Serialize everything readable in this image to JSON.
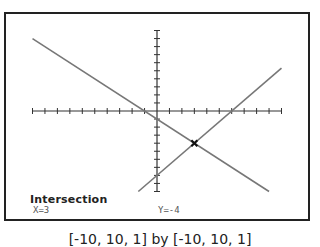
{
  "chart_data": {
    "type": "line",
    "title": "",
    "xlabel": "",
    "ylabel": "",
    "xlim": [
      -10,
      10
    ],
    "ylim": [
      -10,
      10
    ],
    "xscale": 1,
    "yscale": 1,
    "grid": false,
    "series": [
      {
        "name": "Y1",
        "equation": "y = -x - 1",
        "x": [
          -10,
          9
        ],
        "y": [
          9,
          -10
        ]
      },
      {
        "name": "Y2",
        "equation": "y = 4/3 x - 8",
        "x": [
          -1.5,
          10
        ],
        "y": [
          -10,
          5.33
        ]
      }
    ],
    "annotations": [
      {
        "type": "intersection-marker",
        "x": 3,
        "y": -4
      }
    ]
  },
  "screen": {
    "result_title": "Intersection",
    "x_value": "X=3",
    "y_value": "Y=-4"
  },
  "window_caption": "[-10, 10, 1] by [-10, 10, 1]"
}
